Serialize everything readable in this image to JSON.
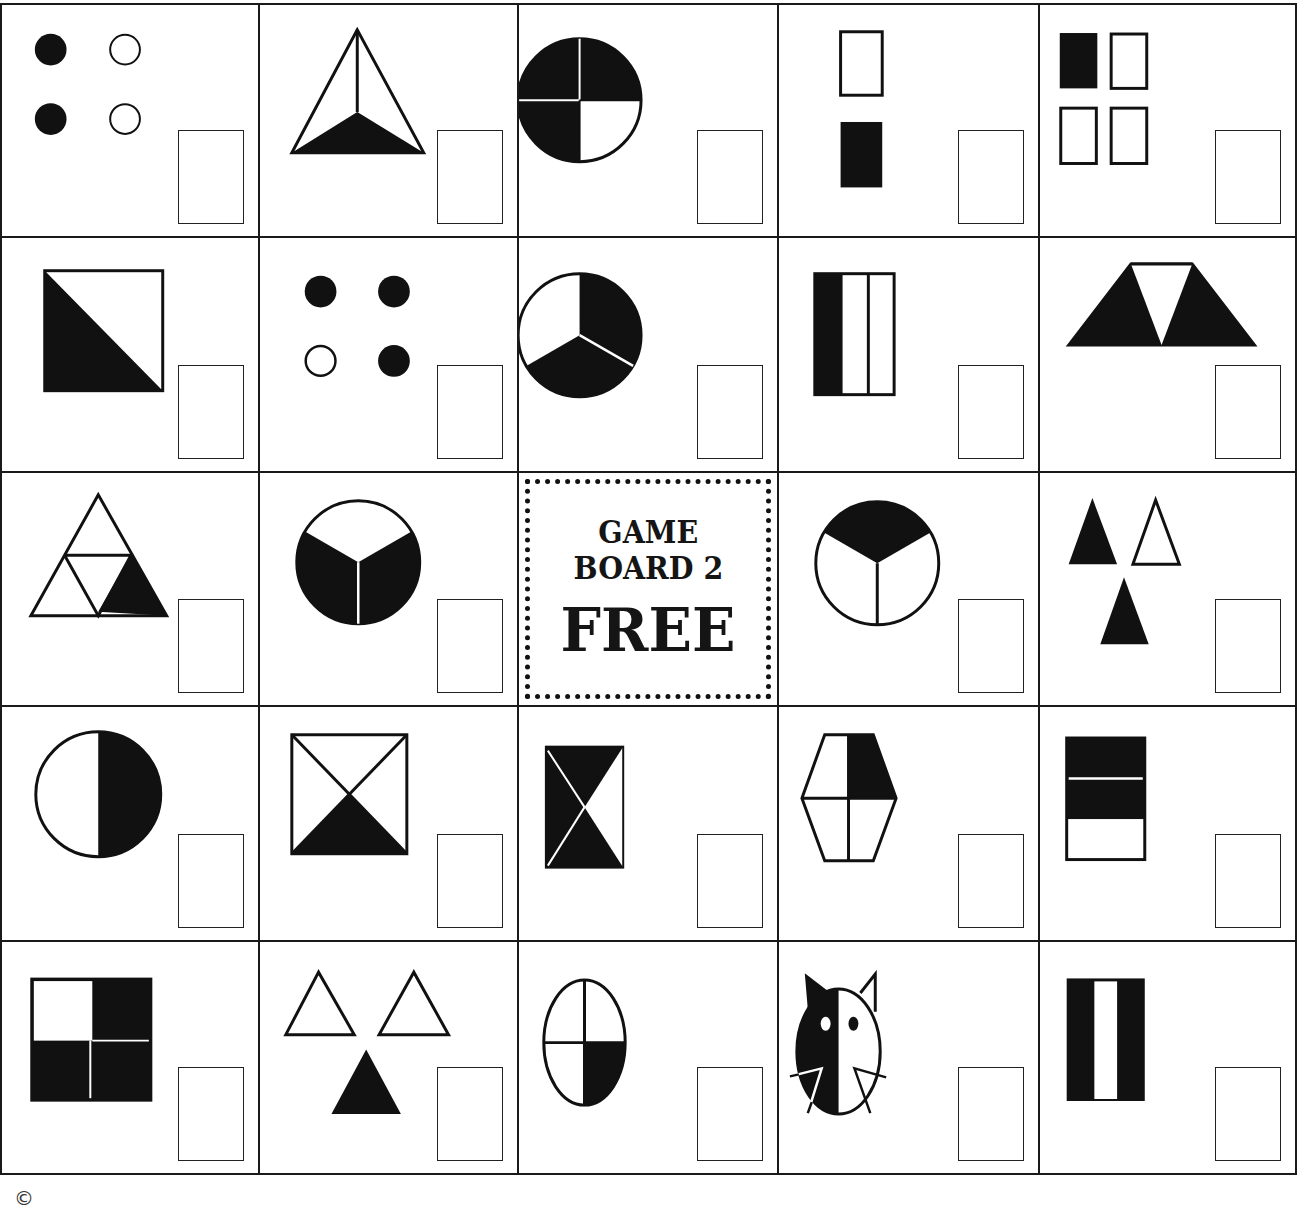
{
  "board": {
    "title": "GAME BOARD 2",
    "rows": 5,
    "cols": 5,
    "free_space": {
      "line1": "GAME",
      "line2": "BOARD 2",
      "label": "FREE"
    },
    "colors": {
      "ink": "#111111",
      "paper": "#ffffff"
    },
    "cells": [
      {
        "row": 1,
        "col": 1,
        "shape": "four-dots-two-filled-left",
        "fraction_shown": "2/4"
      },
      {
        "row": 1,
        "col": 2,
        "shape": "triangle-thirds-bottom-filled",
        "fraction_shown": "1/3"
      },
      {
        "row": 1,
        "col": 3,
        "shape": "circle-quarters-three-filled",
        "fraction_shown": "3/4"
      },
      {
        "row": 1,
        "col": 4,
        "shape": "two-rectangles-bottom-filled",
        "fraction_shown": "1/2"
      },
      {
        "row": 1,
        "col": 5,
        "shape": "four-squares-one-filled",
        "fraction_shown": "1/4"
      },
      {
        "row": 2,
        "col": 1,
        "shape": "square-diagonal-half-filled",
        "fraction_shown": "1/2"
      },
      {
        "row": 2,
        "col": 2,
        "shape": "four-dots-three-filled",
        "fraction_shown": "3/4"
      },
      {
        "row": 2,
        "col": 3,
        "shape": "circle-thirds-two-filled",
        "fraction_shown": "2/3"
      },
      {
        "row": 2,
        "col": 4,
        "shape": "rectangle-thirds-one-filled",
        "fraction_shown": "1/3"
      },
      {
        "row": 2,
        "col": 5,
        "shape": "trapezoid-triangles-two-filled",
        "fraction_shown": "2/3"
      },
      {
        "row": 3,
        "col": 1,
        "shape": "triangle-fourths-one-filled",
        "fraction_shown": "1/4"
      },
      {
        "row": 3,
        "col": 2,
        "shape": "circle-thirds-two-filled-bottom",
        "fraction_shown": "2/3"
      },
      {
        "row": 3,
        "col": 3,
        "shape": "free-space",
        "fraction_shown": ""
      },
      {
        "row": 3,
        "col": 4,
        "shape": "circle-thirds-one-filled-top",
        "fraction_shown": "1/3"
      },
      {
        "row": 3,
        "col": 5,
        "shape": "three-triangles-two-filled",
        "fraction_shown": "2/3"
      },
      {
        "row": 4,
        "col": 1,
        "shape": "circle-half-filled-right",
        "fraction_shown": "1/2"
      },
      {
        "row": 4,
        "col": 2,
        "shape": "square-x-one-filled-bottom",
        "fraction_shown": "1/4"
      },
      {
        "row": 4,
        "col": 3,
        "shape": "rectangle-x-three-filled",
        "fraction_shown": "3/4"
      },
      {
        "row": 4,
        "col": 4,
        "shape": "hexagon-quarters-one-filled",
        "fraction_shown": "1/4"
      },
      {
        "row": 4,
        "col": 5,
        "shape": "rectangle-horizontal-thirds-two-filled",
        "fraction_shown": "2/3"
      },
      {
        "row": 5,
        "col": 1,
        "shape": "square-quarters-three-filled",
        "fraction_shown": "3/4"
      },
      {
        "row": 5,
        "col": 2,
        "shape": "three-triangles-one-filled",
        "fraction_shown": "1/3"
      },
      {
        "row": 5,
        "col": 3,
        "shape": "circle-quarters-one-filled",
        "fraction_shown": "1/4"
      },
      {
        "row": 5,
        "col": 4,
        "shape": "cat-face-half-filled",
        "fraction_shown": "1/2"
      },
      {
        "row": 5,
        "col": 5,
        "shape": "rectangle-vertical-thirds-two-filled",
        "fraction_shown": "2/3"
      }
    ]
  },
  "footer": {
    "copyright_symbol": "©"
  }
}
